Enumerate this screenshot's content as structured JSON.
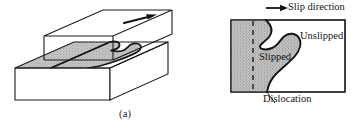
{
  "figure": {
    "domain": "diagram",
    "background_color": "#ffffff",
    "line_color": "#1a1a1a",
    "shade_color": "#b3b3b3",
    "panels": [
      {
        "id": "a",
        "caption": "(a)",
        "description": "three-dimensional block sheared along a slip plane",
        "arrow_name": "shear-direction-arrow"
      },
      {
        "id": "b",
        "caption": "(b)",
        "description": "plan view of the slip plane",
        "labels": {
          "slip_direction": "Slip direction",
          "unslipped": "Unslipped",
          "slipped": "Slipped",
          "dislocation": "Dislocation"
        }
      }
    ]
  }
}
